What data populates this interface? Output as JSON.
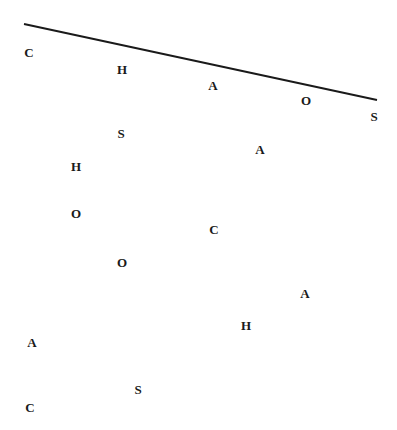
{
  "line": {
    "x1": 24,
    "y1": 24,
    "x2": 377,
    "y2": 100,
    "color": "#1a1a1a",
    "width": 2
  },
  "letters": [
    {
      "char": "C",
      "x": 29,
      "y": 52
    },
    {
      "char": "H",
      "x": 122,
      "y": 69
    },
    {
      "char": "A",
      "x": 213,
      "y": 85
    },
    {
      "char": "O",
      "x": 306,
      "y": 100
    },
    {
      "char": "S",
      "x": 374,
      "y": 116
    },
    {
      "char": "S",
      "x": 121,
      "y": 133
    },
    {
      "char": "A",
      "x": 260,
      "y": 149
    },
    {
      "char": "H",
      "x": 76,
      "y": 166
    },
    {
      "char": "O",
      "x": 76,
      "y": 213
    },
    {
      "char": "C",
      "x": 214,
      "y": 229
    },
    {
      "char": "O",
      "x": 122,
      "y": 262
    },
    {
      "char": "A",
      "x": 305,
      "y": 293
    },
    {
      "char": "H",
      "x": 246,
      "y": 325
    },
    {
      "char": "A",
      "x": 32,
      "y": 342
    },
    {
      "char": "S",
      "x": 138,
      "y": 389
    },
    {
      "char": "C",
      "x": 30,
      "y": 407
    }
  ]
}
